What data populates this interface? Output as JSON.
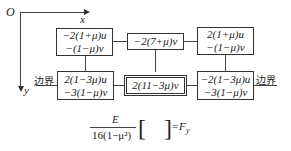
{
  "axes": {
    "origin": "O",
    "x_label": "x",
    "y_label": "y"
  },
  "nodes": [
    {
      "id": "top-left",
      "lines": [
        "−2(1+μ)u",
        "−(1−μ)v"
      ]
    },
    {
      "id": "top-center",
      "lines": [
        "−2(7+μ)v"
      ]
    },
    {
      "id": "top-right",
      "lines": [
        "2(1+μ)u",
        "−(1−μ)v"
      ]
    },
    {
      "id": "bottom-left",
      "lines": [
        "2(1−3μ)u",
        "−3(1−μ)v"
      ]
    },
    {
      "id": "bottom-center",
      "lines": [
        "2(11−3μ)v"
      ],
      "highlighted": true
    },
    {
      "id": "bottom-right",
      "lines": [
        "−2(1−3μ)u",
        "−3(1−μ)v"
      ]
    }
  ],
  "boundary_labels": {
    "left": "边界",
    "right": "边界"
  },
  "formula": {
    "numerator": "E",
    "denominator": "16(1−μ²)",
    "bracket_open": "[",
    "bracket_close": "]",
    "equals": "=",
    "result": "F",
    "result_sub": "y"
  }
}
